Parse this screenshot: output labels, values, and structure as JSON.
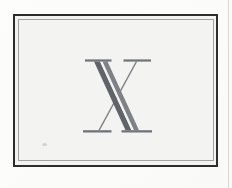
{
  "plate": {
    "letter": "X"
  },
  "colors": {
    "page_bg": "#fbfbfa",
    "panel_bg": "#f3f3f1",
    "frame_outer_rule": "#2d2d2d",
    "frame_inner_rule": "#a3a3a0",
    "letter_dark": "#60646a",
    "letter_mid": "#7e8287",
    "letter_serif": "#707479",
    "letter_inline_stripe": "#f3f3f1",
    "page_edge_line": "#d9d9d5",
    "speck": "#c2c2bf"
  }
}
